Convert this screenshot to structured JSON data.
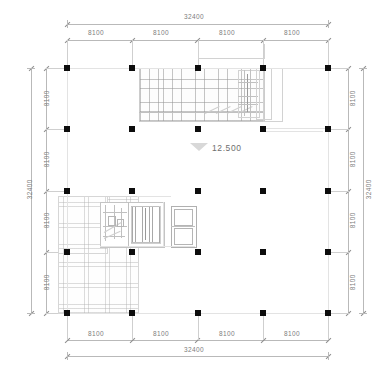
{
  "drawing": {
    "type": "architectural-floor-plan",
    "units": "mm",
    "elevation_marker": {
      "value": "12.500",
      "symbol": "elevation-triangle"
    },
    "overall": {
      "width": "32400",
      "height": "32400"
    },
    "bay": "8100",
    "grid": {
      "columns": 5,
      "rows": 5,
      "bays_x": 4,
      "bays_y": 4
    }
  },
  "dimensions": {
    "top": {
      "overall": "32400",
      "segments": [
        "8100",
        "8100",
        "8100",
        "8100"
      ]
    },
    "bottom": {
      "overall": "32400",
      "segments": [
        "8100",
        "8100",
        "8100",
        "8100"
      ]
    },
    "left": {
      "overall": "32400",
      "segments": [
        "8100",
        "8100",
        "8100",
        "8100"
      ]
    },
    "right": {
      "overall": "32400",
      "segments": [
        "8100",
        "8100",
        "8100",
        "8100"
      ]
    }
  },
  "colors": {
    "column": "#0d0d0d",
    "dimension_line": "#b9b9b9",
    "dimension_text": "#7d7d7d",
    "hatch": "#9a9a9a",
    "room_outline": "#c4c4c4",
    "background": "#ffffff"
  },
  "zones": {
    "upper_hatch_label": "upper-slab-hatch",
    "lower_hatch_label": "lower-slab-hatch",
    "core_label": "service-core",
    "elevator_label": "elevator-bank"
  }
}
